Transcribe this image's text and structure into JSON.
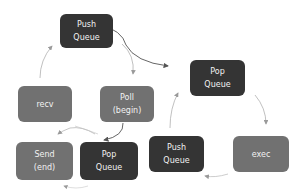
{
  "diagram": {
    "colors": {
      "queue_node": "#343434",
      "process_node": "#717171",
      "arrow": "#9a9a9a",
      "arrow_dark": "#555555",
      "background": "#ffffff"
    },
    "nodes": {
      "push_queue_top": {
        "line1": "Push",
        "line2": "Queue"
      },
      "pop_queue_right": {
        "line1": "Pop",
        "line2": "Queue"
      },
      "recv": {
        "line1": "recv"
      },
      "poll": {
        "line1": "Poll",
        "line2": "(begin)"
      },
      "send": {
        "line1": "Send",
        "line2": "(end)"
      },
      "pop_queue_bottom": {
        "line1": "Pop",
        "line2": "Queue"
      },
      "push_queue_bottom": {
        "line1": "Push",
        "line2": "Queue"
      },
      "exec": {
        "line1": "exec"
      }
    },
    "edges": [
      {
        "from": "recv",
        "to": "push_queue_top"
      },
      {
        "from": "push_queue_top",
        "to": "poll"
      },
      {
        "from": "push_queue_top",
        "to": "pop_queue_right"
      },
      {
        "from": "poll",
        "to": "pop_queue_bottom"
      },
      {
        "from": "poll",
        "to": "recv"
      },
      {
        "from": "pop_queue_right",
        "to": "exec"
      },
      {
        "from": "exec",
        "to": "push_queue_bottom"
      },
      {
        "from": "push_queue_bottom",
        "to": "pop_queue_right"
      },
      {
        "from": "pop_queue_bottom",
        "to": "send"
      }
    ]
  }
}
